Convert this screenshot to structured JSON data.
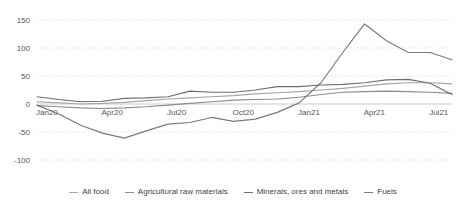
{
  "chart_data": {
    "type": "line",
    "title": "",
    "subtitle": "",
    "xlabel": "",
    "ylabel": "",
    "ylim": [
      -100,
      150
    ],
    "yticks": [
      150,
      100,
      50,
      0,
      -50,
      -100
    ],
    "grid": true,
    "legend_position": "bottom",
    "x": [
      "Jan20",
      "Feb20",
      "Mar20",
      "Apr20",
      "May20",
      "Jun20",
      "Jul20",
      "Aug20",
      "Sep20",
      "Oct20",
      "Nov20",
      "Dec20",
      "Jan21",
      "Feb21",
      "Mar21",
      "Apr21",
      "May21",
      "Jun21",
      "Jul21",
      "Aug21"
    ],
    "xtick_labels": [
      "Jan20",
      "Apr20",
      "Jul20",
      "Oct20",
      "Jan21",
      "Apr21",
      "Jul21"
    ],
    "xtick_indices": [
      0,
      3,
      6,
      9,
      12,
      15,
      18
    ],
    "series": [
      {
        "name": "All food",
        "color": "#a6a6a6",
        "values": [
          4,
          2,
          0,
          1,
          3,
          6,
          9,
          11,
          13,
          15,
          18,
          20,
          22,
          25,
          28,
          32,
          36,
          38,
          38,
          36
        ]
      },
      {
        "name": "Agricultural raw materials",
        "color": "#8c8c8c",
        "values": [
          -3,
          -5,
          -7,
          -8,
          -7,
          -5,
          -2,
          1,
          4,
          7,
          8,
          9,
          12,
          17,
          21,
          22,
          23,
          22,
          21,
          19
        ]
      },
      {
        "name": "Minerals, ores and metals",
        "color": "#6e6e6e",
        "values": [
          13,
          8,
          4,
          5,
          10,
          11,
          13,
          23,
          21,
          21,
          25,
          31,
          31,
          34,
          35,
          38,
          43,
          44,
          37,
          17
        ]
      },
      {
        "name": "Fuels",
        "color": "#7a7a7a",
        "values": [
          -2,
          -18,
          -38,
          -52,
          -61,
          -48,
          -36,
          -33,
          -24,
          -31,
          -27,
          -15,
          2,
          38,
          92,
          143,
          113,
          92,
          92,
          79
        ]
      }
    ]
  },
  "legend": {
    "items": [
      {
        "label": "All food"
      },
      {
        "label": "Agricultural raw materials"
      },
      {
        "label": "Minerals, ores and metals"
      },
      {
        "label": "Fuels"
      }
    ]
  }
}
